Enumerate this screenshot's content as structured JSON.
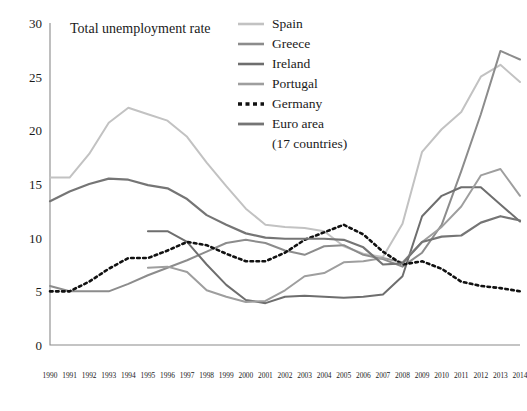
{
  "chart_data": {
    "type": "line",
    "title": "Total unemployment rate",
    "xlabel": "",
    "ylabel": "",
    "xlim": [
      1990,
      2014
    ],
    "ylim": [
      0,
      30
    ],
    "ytick_step": 5,
    "grid": false,
    "legend_position": "top-right",
    "x": [
      1990,
      1991,
      1992,
      1993,
      1994,
      1995,
      1996,
      1997,
      1998,
      1999,
      2000,
      2001,
      2002,
      2003,
      2004,
      2005,
      2006,
      2007,
      2008,
      2009,
      2010,
      2011,
      2012,
      2013,
      2014
    ],
    "ytick_labels": [
      "0",
      "5",
      "10",
      "15",
      "20",
      "25",
      "30"
    ],
    "xtick_labels": [
      "1990",
      "1991",
      "1992",
      "1993",
      "1994",
      "1995",
      "1996",
      "1997",
      "1998",
      "1999",
      "2000",
      "2001",
      "2002",
      "2003",
      "2004",
      "2005",
      "2006",
      "2007",
      "2008",
      "2009",
      "2010",
      "2011",
      "2012",
      "2013",
      "2014"
    ],
    "series": [
      {
        "name": "Spain",
        "color": "#c2c2c2",
        "width": 2.0,
        "dashed": false,
        "x": [
          1990,
          1991,
          1992,
          1993,
          1994,
          1995,
          1996,
          1997,
          1998,
          1999,
          2000,
          2001,
          2002,
          2003,
          2004,
          2005,
          2006,
          2007,
          2008,
          2009,
          2010,
          2011,
          2012,
          2013,
          2014
        ],
        "values": [
          15.6,
          15.6,
          17.8,
          20.7,
          22.1,
          21.5,
          20.9,
          19.4,
          17.0,
          14.8,
          12.7,
          11.2,
          11.0,
          10.9,
          10.6,
          9.2,
          8.5,
          8.2,
          11.3,
          18.0,
          20.1,
          21.7,
          25.0,
          26.1,
          24.5
        ]
      },
      {
        "name": "Greece",
        "color": "#8c8c8c",
        "width": 2.0,
        "dashed": false,
        "x": [
          1990,
          1991,
          1992,
          1993,
          1994,
          1995,
          1996,
          1997,
          1998,
          1999,
          2000,
          2001,
          2002,
          2003,
          2004,
          2005,
          2006,
          2007,
          2008,
          2009,
          2010,
          2011,
          2012,
          2013,
          2014
        ],
        "values": [
          5.5,
          5.0,
          5.0,
          5.0,
          5.7,
          6.5,
          7.2,
          7.9,
          8.7,
          9.5,
          9.8,
          9.5,
          8.8,
          8.4,
          9.2,
          9.3,
          8.4,
          8.0,
          7.3,
          8.6,
          11.2,
          16.2,
          21.5,
          27.4,
          26.6
        ]
      },
      {
        "name": "Ireland",
        "color": "#6e6e6e",
        "width": 2.0,
        "dashed": false,
        "x": [
          1995,
          1996,
          1997,
          1998,
          1999,
          2000,
          2001,
          2002,
          2003,
          2004,
          2005,
          2006,
          2007,
          2008,
          2009,
          2010,
          2011,
          2012,
          2013,
          2014
        ],
        "values": [
          10.6,
          10.6,
          9.6,
          7.5,
          5.6,
          4.2,
          3.9,
          4.5,
          4.6,
          4.5,
          4.4,
          4.5,
          4.7,
          6.4,
          12.0,
          13.9,
          14.7,
          14.7,
          13.1,
          11.5
        ]
      },
      {
        "name": "Portugal",
        "color": "#9e9e9e",
        "width": 2.0,
        "dashed": false,
        "x": [
          1995,
          1996,
          1997,
          1998,
          1999,
          2000,
          2001,
          2002,
          2003,
          2004,
          2005,
          2006,
          2007,
          2008,
          2009,
          2010,
          2011,
          2012,
          2013,
          2014
        ],
        "values": [
          7.2,
          7.3,
          6.8,
          5.1,
          4.5,
          4.0,
          4.1,
          5.1,
          6.4,
          6.7,
          7.7,
          7.8,
          8.1,
          7.7,
          9.6,
          11.0,
          12.9,
          15.8,
          16.4,
          13.9
        ]
      },
      {
        "name": "Germany",
        "color": "#111111",
        "width": 2.6,
        "dashed": true,
        "x": [
          1990,
          1991,
          1992,
          1993,
          1994,
          1995,
          1996,
          1997,
          1998,
          1999,
          2000,
          2001,
          2002,
          2003,
          2004,
          2005,
          2006,
          2007,
          2008,
          2009,
          2010,
          2011,
          2012,
          2013,
          2014
        ],
        "values": [
          5.0,
          5.0,
          5.9,
          7.1,
          8.1,
          8.1,
          8.8,
          9.6,
          9.3,
          8.5,
          7.8,
          7.8,
          8.6,
          9.8,
          10.5,
          11.2,
          10.3,
          8.7,
          7.5,
          7.8,
          7.1,
          5.9,
          5.5,
          5.3,
          5.0
        ]
      },
      {
        "name": "Euro area (17 countries)",
        "legend_line1": "Euro area",
        "legend_line2": "(17 countries)",
        "color": "#757575",
        "width": 2.2,
        "dashed": false,
        "x": [
          1990,
          1991,
          1992,
          1993,
          1994,
          1995,
          1996,
          1997,
          1998,
          1999,
          2000,
          2001,
          2002,
          2003,
          2004,
          2005,
          2006,
          2007,
          2008,
          2009,
          2010,
          2011,
          2012,
          2013,
          2014
        ],
        "values": [
          13.4,
          14.3,
          15.0,
          15.5,
          15.4,
          14.9,
          14.6,
          13.6,
          12.1,
          11.2,
          10.4,
          10.0,
          9.9,
          9.9,
          9.9,
          9.8,
          9.1,
          7.5,
          7.6,
          9.6,
          10.1,
          10.2,
          11.4,
          12.0,
          11.6
        ]
      }
    ]
  }
}
